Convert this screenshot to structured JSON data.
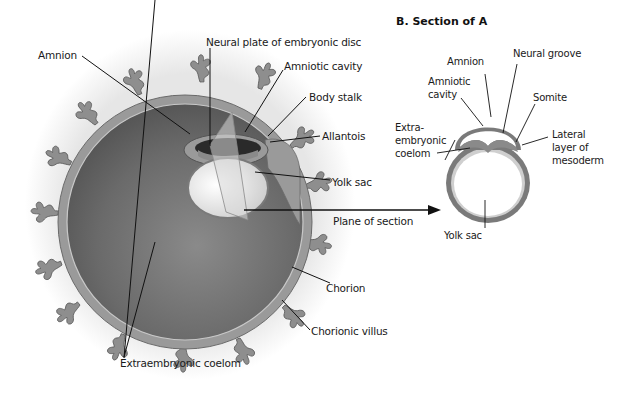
{
  "figure": {
    "panel_b_title": "B. Section of A",
    "panel_a": {
      "labels": {
        "amnion": "Amnion",
        "neural_plate": "Neural plate of embryonic disc",
        "amniotic_cavity": "Amniotic cavity",
        "body_stalk": "Body stalk",
        "allantois": "Allantois",
        "yolk_sac": "Yolk sac",
        "plane_of_section": "Plane of section",
        "chorion": "Chorion",
        "chorionic_villus": "Chorionic villus",
        "extraembryonic_coelom": "Extraembryonic coelom"
      }
    },
    "panel_b": {
      "labels": {
        "amnion": "Amnion",
        "neural_groove": "Neural groove",
        "amniotic_cavity_1": "Amniotic",
        "amniotic_cavity_2": "cavity",
        "somite": "Somite",
        "extra_1": "Extra-",
        "extra_2": "embryonic",
        "extra_3": "coelom",
        "lateral_1": "Lateral",
        "lateral_2": "layer of",
        "lateral_3": "mesoderm",
        "yolk_sac": "Yolk sac"
      }
    },
    "colors": {
      "coelom_dark": "#6b6b6b",
      "chorion": "#9a9a9a",
      "villus": "#8e8e8e",
      "yolk": "#ececec",
      "amnion_wall": "#7a7a7a",
      "line": "#111111"
    }
  }
}
